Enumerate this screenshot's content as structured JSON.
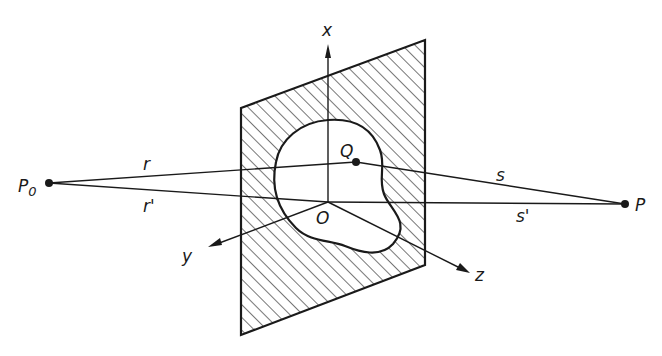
{
  "diagram": {
    "type": "geometric-optics-aperture",
    "points": {
      "source": {
        "label": "P",
        "subscript": "0",
        "x": 49,
        "y": 183
      },
      "observer": {
        "label": "P",
        "x": 625,
        "y": 204
      },
      "aperture_point": {
        "label": "Q",
        "x": 356,
        "y": 162
      },
      "origin": {
        "label": "O",
        "x": 328,
        "y": 202
      }
    },
    "distances": {
      "r": "r",
      "r_prime": "r'",
      "s": "s",
      "s_prime": "s'"
    },
    "axes": {
      "x": "x",
      "y": "y",
      "z": "z"
    },
    "colors": {
      "ink": "#1a1a1a",
      "background": "#ffffff"
    }
  }
}
